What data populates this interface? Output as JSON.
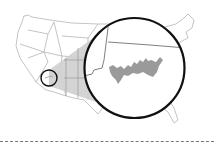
{
  "map": {
    "type": "locator-map",
    "region": "contiguous-united-states",
    "inset_subject": "lake",
    "colors": {
      "background": "#ffffff",
      "state_borders": "#b5b5b5",
      "callout_fill": "#cfcfcf",
      "circle_stroke": "#111111",
      "lake_fill": "#9a9a9a",
      "inset_borders": "#808080",
      "divider": "#777777"
    },
    "locator_circle": {
      "cx": 49,
      "cy": 78,
      "r": 8
    },
    "magnifier_circle": {
      "cx": 134.5,
      "cy": 68,
      "r": 50
    }
  }
}
